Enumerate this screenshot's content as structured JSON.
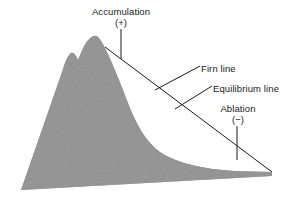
{
  "figure": {
    "background_color": "#ffffff",
    "line_color": "#1a1a1a",
    "glacier_fill_color": "#9a9a9a",
    "text_color": "#1a1a1a"
  },
  "labels": {
    "accumulation": {
      "text": "Accumulation",
      "sign": "(+)"
    },
    "ablation": {
      "text": "Ablation",
      "sign": "(−)"
    },
    "firn_line": {
      "text": "Firn line"
    },
    "equilibrium_line": {
      "text": "Equilibrium line"
    }
  },
  "diagram_data": {
    "type": "cross-section",
    "elements": [
      {
        "name": "mountain-glacier-mass",
        "description": "Shaded gray mountain and glacier profile with twin summit on the left and a long concave tongue sloping to the lower right",
        "fill": "#9a9a9a"
      },
      {
        "name": "glacier-surface-line",
        "description": "Straight line from the summit at upper left down to the glacier terminus at lower right",
        "from": [
          105,
          47
        ],
        "to": [
          272,
          172
        ]
      },
      {
        "name": "accumulation-leader",
        "description": "Vertical leader from the Accumulation label down to the glacier surface line",
        "from": [
          121,
          29
        ],
        "to": [
          121,
          59
        ]
      },
      {
        "name": "ablation-leader",
        "description": "Vertical leader from the Ablation label down to the glacier surface line",
        "from": [
          237,
          126
        ],
        "to": [
          237,
          160
        ]
      },
      {
        "name": "firn-line-leader",
        "description": "Short diagonal tick crossing the glacier surface line pointing to the Firn line label",
        "from": [
          200,
          66
        ],
        "to": [
          155,
          90
        ]
      },
      {
        "name": "equilibrium-line-leader",
        "description": "Short diagonal tick crossing the glacier surface line pointing to the Equilibrium line label",
        "from": [
          212,
          86
        ],
        "to": [
          175,
          109
        ]
      }
    ]
  }
}
